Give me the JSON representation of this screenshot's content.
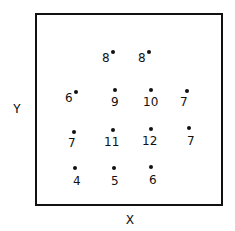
{
  "chart_data": {
    "type": "scatter",
    "title": "",
    "xlabel": "X",
    "ylabel": "Y",
    "grid": false,
    "legend": null,
    "points": [
      {
        "x": 2,
        "y": 4,
        "label": "8",
        "px": 113,
        "py": 52,
        "lx": -11,
        "ly": 0
      },
      {
        "x": 3,
        "y": 4,
        "label": "8",
        "px": 149,
        "py": 52,
        "lx": -11,
        "ly": 0
      },
      {
        "x": 1,
        "y": 3,
        "label": "6",
        "px": 76,
        "py": 92,
        "lx": -11,
        "ly": 0
      },
      {
        "x": 2,
        "y": 3,
        "label": "9",
        "px": 115,
        "py": 90,
        "lx": -4,
        "ly": 6
      },
      {
        "x": 3,
        "y": 3,
        "label": "10",
        "px": 151,
        "py": 90,
        "lx": -8,
        "ly": 6
      },
      {
        "x": 4,
        "y": 3,
        "label": "7",
        "px": 187,
        "py": 91,
        "lx": -7,
        "ly": 5
      },
      {
        "x": 1,
        "y": 2,
        "label": "7",
        "px": 74,
        "py": 132,
        "lx": -6,
        "ly": 5
      },
      {
        "x": 2,
        "y": 2,
        "label": "11",
        "px": 113,
        "py": 130,
        "lx": -9,
        "ly": 6
      },
      {
        "x": 3,
        "y": 2,
        "label": "12",
        "px": 151,
        "py": 129,
        "lx": -9,
        "ly": 6
      },
      {
        "x": 4,
        "y": 2,
        "label": "7",
        "px": 189,
        "py": 128,
        "lx": -2,
        "ly": 7
      },
      {
        "x": 1,
        "y": 1,
        "label": "4",
        "px": 75,
        "py": 168,
        "lx": -2,
        "ly": 7
      },
      {
        "x": 2,
        "y": 1,
        "label": "5",
        "px": 114,
        "py": 168,
        "lx": -3,
        "ly": 7
      },
      {
        "x": 3,
        "y": 1,
        "label": "6",
        "px": 151,
        "py": 167,
        "lx": -2,
        "ly": 7
      }
    ]
  },
  "axes": {
    "x_label": "X",
    "y_label": "Y"
  }
}
